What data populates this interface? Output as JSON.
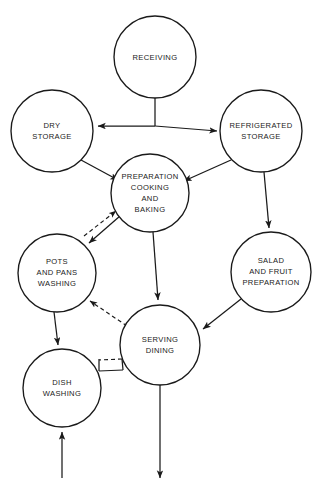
{
  "diagram": {
    "type": "flowchart",
    "canvas": {
      "width": 317,
      "height": 484
    },
    "background_color": "#ffffff",
    "line_color": "#1a1a1a",
    "text_color": "#222222",
    "nodes": [
      {
        "id": "receiving",
        "label_lines": [
          "RECEIVING"
        ],
        "cx": 155,
        "cy": 57,
        "r": 41
      },
      {
        "id": "dry_storage",
        "label_lines": [
          "DRY",
          "STORAGE"
        ],
        "cx": 52,
        "cy": 131,
        "r": 41
      },
      {
        "id": "refrigerated_storage",
        "label_lines": [
          "REFRIGERATED",
          "STORAGE"
        ],
        "cx": 261,
        "cy": 131,
        "r": 41
      },
      {
        "id": "preparation",
        "label_lines": [
          "PREPARATION",
          "COOKING",
          "AND",
          "BAKING"
        ],
        "cx": 150,
        "cy": 193,
        "r": 39
      },
      {
        "id": "pots_pans_washing",
        "label_lines": [
          "POTS",
          "AND PANS",
          "WASHING"
        ],
        "cx": 57,
        "cy": 273,
        "r": 39
      },
      {
        "id": "salad_fruit_preparation",
        "label_lines": [
          "SALAD",
          "AND FRUIT",
          "PREPARATION"
        ],
        "cx": 271,
        "cy": 272,
        "r": 40
      },
      {
        "id": "serving_dining",
        "label_lines": [
          "SERVING",
          "DINING"
        ],
        "cx": 160,
        "cy": 345,
        "r": 40
      },
      {
        "id": "dish_washing",
        "label_lines": [
          "DISH",
          "WASHING"
        ],
        "cx": 62,
        "cy": 388,
        "r": 39
      }
    ],
    "edges": [
      {
        "id": "receiving-to-dry-storage",
        "from": "receiving",
        "to": "dry_storage",
        "style": "solid",
        "arrow": "single"
      },
      {
        "id": "receiving-to-refrigerated-storage",
        "from": "receiving",
        "to": "refrigerated_storage",
        "style": "solid",
        "arrow": "single"
      },
      {
        "id": "dry-storage-to-preparation",
        "from": "dry_storage",
        "to": "preparation",
        "style": "solid",
        "arrow": "single"
      },
      {
        "id": "refrigerated-storage-to-preparation",
        "from": "refrigerated_storage",
        "to": "preparation",
        "style": "solid",
        "arrow": "single"
      },
      {
        "id": "refrigerated-storage-to-salad-preparation",
        "from": "refrigerated_storage",
        "to": "salad_fruit_preparation",
        "style": "solid",
        "arrow": "single"
      },
      {
        "id": "preparation-to-serving-dining",
        "from": "preparation",
        "to": "serving_dining",
        "style": "solid",
        "arrow": "single"
      },
      {
        "id": "salad-preparation-to-serving-dining",
        "from": "salad_fruit_preparation",
        "to": "serving_dining",
        "style": "solid",
        "arrow": "single"
      },
      {
        "id": "preparation-to-pots-pans-washing",
        "from": "preparation",
        "to": "pots_pans_washing",
        "style": "solid",
        "arrow": "single"
      },
      {
        "id": "pots-pans-washing-to-preparation",
        "from": "pots_pans_washing",
        "to": "preparation",
        "style": "dashed",
        "arrow": "single"
      },
      {
        "id": "serving-dining-to-pots-pans-washing",
        "from": "serving_dining",
        "to": "pots_pans_washing",
        "style": "dashed",
        "arrow": "single"
      },
      {
        "id": "serving-dining-to-dish-washing",
        "from": "serving_dining",
        "to": "dish_washing",
        "style": "dashed",
        "arrow": "none"
      },
      {
        "id": "dish-washing-to-serving-dining",
        "from": "dish_washing",
        "to": "serving_dining",
        "style": "solid",
        "arrow": "none"
      },
      {
        "id": "pots-pans-washing-to-dish-washing",
        "from": "pots_pans_washing",
        "to": "dish_washing",
        "style": "solid",
        "arrow": "single"
      },
      {
        "id": "external-inflow-to-dish-washing",
        "from": "external",
        "to": "dish_washing",
        "style": "solid",
        "arrow": "single"
      },
      {
        "id": "serving-dining-to-external-outflow",
        "from": "serving_dining",
        "to": "external",
        "style": "solid",
        "arrow": "single"
      }
    ]
  }
}
